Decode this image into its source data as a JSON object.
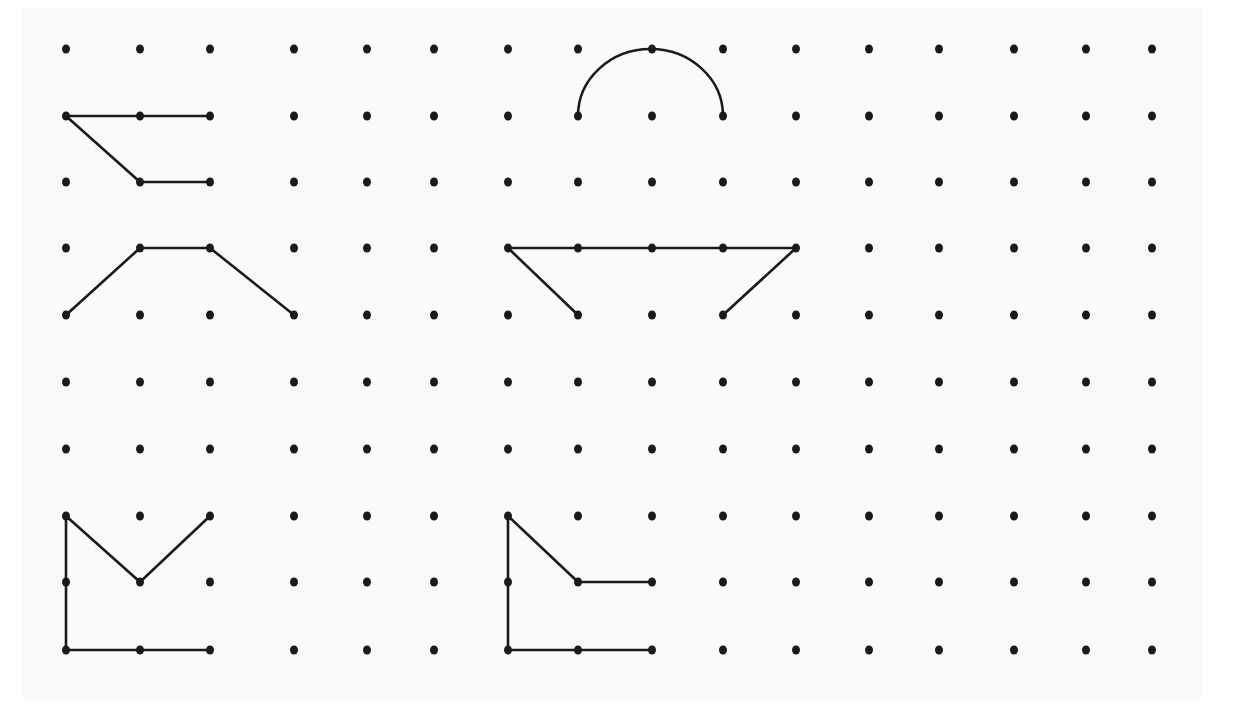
{
  "diagram": {
    "type": "dot-grid-figures",
    "background_color": "#fafafa",
    "dot_color": "#1a1a1a",
    "line_color": "#1a1a1a",
    "grid": {
      "columns": 16,
      "rows": 10,
      "col_x": [
        66,
        140,
        210,
        294,
        367,
        434,
        508,
        578,
        652,
        723,
        796,
        869,
        939,
        1014,
        1086,
        1152
      ],
      "row_y": [
        49,
        116,
        182,
        248,
        315,
        382,
        449,
        516,
        582,
        650
      ],
      "dot_radius": 4
    },
    "figures": [
      {
        "name": "figure-z-shape",
        "segments": [
          [
            [
              0,
              1
            ],
            [
              2,
              1
            ]
          ],
          [
            [
              0,
              1
            ],
            [
              1,
              2
            ]
          ],
          [
            [
              1,
              2
            ],
            [
              2,
              2
            ]
          ]
        ]
      },
      {
        "name": "figure-trapezoid-open",
        "segments": [
          [
            [
              0,
              4
            ],
            [
              1,
              3
            ]
          ],
          [
            [
              1,
              3
            ],
            [
              2,
              3
            ]
          ],
          [
            [
              2,
              3
            ],
            [
              3,
              4
            ]
          ]
        ]
      },
      {
        "name": "figure-semicircle",
        "arc": {
          "from": [
            7,
            1
          ],
          "through": [
            8,
            0
          ],
          "to": [
            9,
            1
          ]
        }
      },
      {
        "name": "figure-bowl",
        "segments": [
          [
            [
              6,
              3
            ],
            [
              10,
              3
            ]
          ],
          [
            [
              6,
              3
            ],
            [
              7,
              4
            ]
          ],
          [
            [
              10,
              3
            ],
            [
              9,
              4
            ]
          ]
        ]
      },
      {
        "name": "figure-v-with-l",
        "segments": [
          [
            [
              0,
              7
            ],
            [
              0,
              9
            ]
          ],
          [
            [
              0,
              9
            ],
            [
              2,
              9
            ]
          ],
          [
            [
              0,
              7
            ],
            [
              1,
              8
            ]
          ],
          [
            [
              1,
              8
            ],
            [
              2,
              7
            ]
          ]
        ]
      },
      {
        "name": "figure-l-with-step",
        "segments": [
          [
            [
              6,
              7
            ],
            [
              6,
              9
            ]
          ],
          [
            [
              6,
              9
            ],
            [
              8,
              9
            ]
          ],
          [
            [
              6,
              7
            ],
            [
              7,
              8
            ]
          ],
          [
            [
              7,
              8
            ],
            [
              8,
              8
            ]
          ]
        ]
      }
    ]
  }
}
